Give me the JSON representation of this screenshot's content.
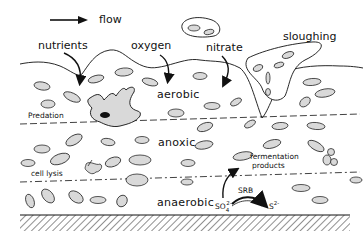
{
  "diagram": {
    "type": "biofilm-cross-section",
    "flow_label": "flow",
    "inputs": {
      "nutrients": "nutrients",
      "oxygen": "oxygen",
      "nitrate": "nitrate"
    },
    "sloughing_label": "sloughing",
    "zones": {
      "aerobic": "aerobic",
      "anoxic": "anoxic",
      "anaerobic": "anaerobic"
    },
    "processes": {
      "predation": "Predation",
      "cell_lysis": "cell lysis",
      "fermentation_line1": "fermentation",
      "fermentation_line2": "products",
      "srb": "SRB",
      "sulfate": "SO4²⁻",
      "sulfate_base": "SO",
      "sulfate_sub": "4",
      "sulfate_sup": "2-",
      "sulfide_base": "S",
      "sulfide_sup": "2-"
    },
    "colors": {
      "line": "#111111",
      "cell_fill": "#d9d9d9",
      "background": "#ffffff"
    }
  }
}
